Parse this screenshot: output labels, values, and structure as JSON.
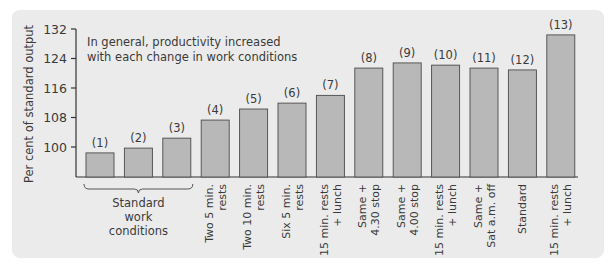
{
  "chart_data": {
    "type": "bar",
    "title": "",
    "xlabel": "",
    "ylabel": "Per cent of standard output",
    "ylim": [
      92,
      132
    ],
    "yticks": [
      100,
      108,
      116,
      124,
      132
    ],
    "grid": false,
    "annotation": "In general, productivity increased with each change in work conditions",
    "bar_labels": [
      "(1)",
      "(2)",
      "(3)",
      "(4)",
      "(5)",
      "(6)",
      "(7)",
      "(8)",
      "(9)",
      "(10)",
      "(11)",
      "(12)",
      "(13)"
    ],
    "categories": [
      "Standard work conditions",
      "Standard work conditions",
      "Standard work conditions",
      "Two 5 min. rests",
      "Two 10 min. rests",
      "Six 5 min. rests",
      "15 min. rests + lunch",
      "Same + 4.30 stop",
      "Same + 4.00 stop",
      "15 min. rests + lunch",
      "Same + Sat a.m. off",
      "Standard",
      "15 min. rests + lunch"
    ],
    "tick_labels": [
      [
        "Two 5 min.",
        "rests"
      ],
      [
        "Two 10 min.",
        "rests"
      ],
      [
        "Six 5 min.",
        "rests"
      ],
      [
        "15 min. rests",
        "+ lunch"
      ],
      [
        "Same +",
        "4.30 stop"
      ],
      [
        "Same +",
        "4.00 stop"
      ],
      [
        "15 min. rests",
        "+ lunch"
      ],
      [
        "Same +",
        "Sat a.m. off"
      ],
      [
        "Standard"
      ],
      [
        "15 min. rests",
        "+ lunch"
      ]
    ],
    "group_label": [
      "Standard",
      "work",
      "conditions"
    ],
    "values": [
      98.4,
      99.7,
      102.4,
      107.3,
      110.3,
      111.9,
      114.0,
      121.4,
      122.8,
      122.2,
      121.4,
      120.9,
      130.4
    ],
    "colors": {
      "bar": "#b8b8b8",
      "bar_edge": "#4a4a4a",
      "axis": "#333333",
      "panel": "#ebebeb"
    }
  }
}
